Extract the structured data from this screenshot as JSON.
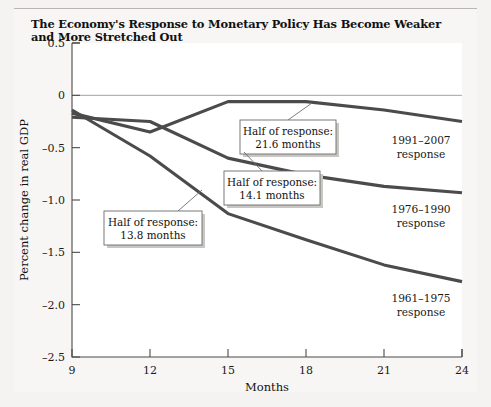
{
  "figure": {
    "title": "The Economy's Response to Monetary Policy Has Become Weaker and More Stretched Out"
  },
  "chart_data": {
    "type": "line",
    "title": "The Economy's Response to Monetary Policy Has Become Weaker and More Stretched Out",
    "xlabel": "Months",
    "ylabel": "Percent change in real GDP",
    "xlim": [
      9,
      24
    ],
    "ylim": [
      -2.5,
      0.5
    ],
    "xticks": [
      9,
      12,
      15,
      18,
      21,
      24
    ],
    "xticklabels": [
      "9",
      "12",
      "15",
      "18",
      "21",
      "24"
    ],
    "yticks": [
      0.5,
      0,
      -0.5,
      -1.0,
      -1.5,
      -2.0,
      -2.5
    ],
    "yticklabels": [
      "0.5",
      "0",
      "-0.5",
      "-1.0",
      "-1.5",
      "-2.0",
      "-2.5"
    ],
    "grid": false,
    "legend_position": "inline-right-labels",
    "zero_reference_line": true,
    "series": [
      {
        "name": "1991-2007 response",
        "label_line1": "1991–2007",
        "label_line2": "response",
        "color": "#4b4b4b",
        "x": [
          9,
          12,
          15,
          18,
          21,
          24
        ],
        "y": [
          -0.17,
          -0.35,
          -0.06,
          -0.06,
          -0.14,
          -0.25
        ]
      },
      {
        "name": "1976-1990 response",
        "label_line1": "1976–1990",
        "label_line2": "response",
        "color": "#4b4b4b",
        "x": [
          9,
          12,
          15,
          18,
          21,
          24
        ],
        "y": [
          -0.21,
          -0.25,
          -0.6,
          -0.76,
          -0.87,
          -0.93
        ]
      },
      {
        "name": "1961-1975 response",
        "label_line1": "1961–1975",
        "label_line2": "response",
        "color": "#4b4b4b",
        "x": [
          9,
          12,
          15,
          18,
          21,
          24
        ],
        "y": [
          -0.14,
          -0.58,
          -1.13,
          -1.38,
          -1.62,
          -1.78
        ]
      }
    ],
    "annotations": [
      {
        "id": "callout-21-6",
        "line1": "Half of response:",
        "line2": "21.6 months",
        "target_series": "1991-2007 response"
      },
      {
        "id": "callout-14-1",
        "line1": "Half of response:",
        "line2": "14.1 months",
        "target_series": "1976-1990 response"
      },
      {
        "id": "callout-13-8",
        "line1": "Half of response:",
        "line2": "13.8 months",
        "target_series": "1961-1975 response"
      }
    ]
  }
}
